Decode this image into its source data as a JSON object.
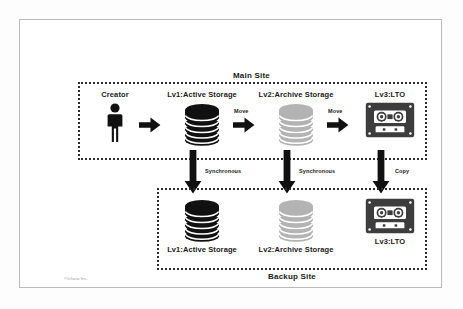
{
  "diagram": {
    "title_hidden": "",
    "sites": [
      {
        "id": "main",
        "label": "Main Site"
      },
      {
        "id": "backup",
        "label": "Backup Site"
      }
    ],
    "main_site": {
      "label": "Main Site",
      "nodes": [
        {
          "id": "creator",
          "label": "Creator",
          "icon": "person-icon",
          "color": "#111111"
        },
        {
          "id": "active",
          "label": "Lv1:Active Storage",
          "icon": "database-icon",
          "color": "#111111"
        },
        {
          "id": "archive",
          "label": "Lv2:Archive Storage",
          "icon": "database-icon",
          "color": "#b3b3b3"
        },
        {
          "id": "lto",
          "label": "Lv3:LTO",
          "icon": "tape-cartridge-icon",
          "color": "#3d3d3d"
        }
      ]
    },
    "backup_site": {
      "label": "Backup Site",
      "nodes": [
        {
          "id": "active",
          "label": "Lv1:Active Storage",
          "icon": "database-icon",
          "color": "#111111"
        },
        {
          "id": "archive",
          "label": "Lv2:Archive Storage",
          "icon": "database-icon",
          "color": "#b3b3b3"
        },
        {
          "id": "lto",
          "label": "Lv3:LTO",
          "icon": "tape-cartridge-icon",
          "color": "#3d3d3d"
        }
      ]
    },
    "horizontal_edges": [
      {
        "id": "creator-to-active",
        "label": ""
      },
      {
        "id": "active-to-archive",
        "label": "Move"
      },
      {
        "id": "archive-to-lto",
        "label": "Move"
      }
    ],
    "vertical_edges": [
      {
        "id": "active-to-backup-active",
        "label": "Synchronous"
      },
      {
        "id": "archive-to-backup-archive",
        "label": "Synchronous"
      },
      {
        "id": "lto-to-backup-lto",
        "label": "Copy"
      }
    ],
    "footer": {
      "credit": "©Ichara Inc."
    },
    "colors": {
      "ink": "#1a1a1a",
      "active_storage": "#111111",
      "archive_storage": "#b3b3b3",
      "tape": "#3d3d3d",
      "frame": "#b9b9b9",
      "dotted_border": "#2b2b2b"
    }
  }
}
